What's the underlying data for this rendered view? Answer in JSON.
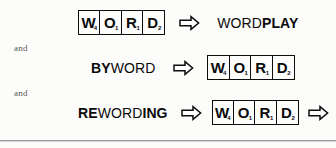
{
  "canvas": {
    "width": 336,
    "height": 148,
    "background": "#fcfcfb"
  },
  "ink": {
    "text": "#0b0b0b",
    "tile_border": "#0d0d0d",
    "conjunction": "#58585a",
    "rule": "#9b9b9b"
  },
  "connectors": {
    "first": "and",
    "second": "and"
  },
  "tile_rack": {
    "tiles": [
      {
        "letter": "W",
        "score": "4"
      },
      {
        "letter": "O",
        "score": "1"
      },
      {
        "letter": "R",
        "score": "1"
      },
      {
        "letter": "D",
        "score": "2"
      }
    ]
  },
  "icons": {
    "arrow": "rightwards-hollow-arrow"
  },
  "rows": [
    {
      "id": "wordplay",
      "left_type": "rack",
      "right_type": "text",
      "word": {
        "full": "WORDPLAY",
        "parts": [
          {
            "text": "WORD",
            "weight": "regular"
          },
          {
            "text": "PLAY",
            "weight": "bold"
          }
        ]
      },
      "trailing_arrow": false
    },
    {
      "id": "byword",
      "left_type": "text",
      "right_type": "rack",
      "word": {
        "full": "BYWORD",
        "parts": [
          {
            "text": "BY",
            "weight": "bold"
          },
          {
            "text": "WORD",
            "weight": "regular"
          }
        ]
      },
      "trailing_arrow": false
    },
    {
      "id": "rewording",
      "left_type": "text",
      "right_type": "rack",
      "word": {
        "full": "REWORDING",
        "parts": [
          {
            "text": "RE",
            "weight": "bold"
          },
          {
            "text": "WORD",
            "weight": "regular"
          },
          {
            "text": "ING",
            "weight": "bold"
          }
        ]
      },
      "trailing_arrow": true
    }
  ]
}
